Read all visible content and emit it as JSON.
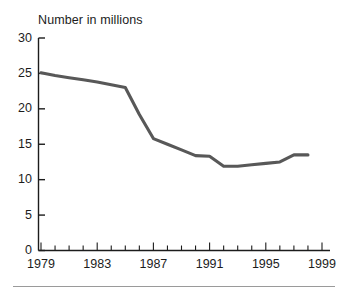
{
  "figure": {
    "title": "Number in millions",
    "line_color": "#585858",
    "axis_color": "#1c1c1c",
    "rule_color": "#9a9a9a",
    "background": "#ffffff"
  },
  "axes": {
    "y_ticks": [
      "0",
      "5",
      "10",
      "15",
      "20",
      "25",
      "30"
    ],
    "x_ticks": [
      "1979",
      "1983",
      "1987",
      "1991",
      "1995",
      "1999"
    ]
  },
  "chart_data": {
    "type": "line",
    "title": "Number in millions",
    "xlabel": "",
    "ylabel": "Number in millions",
    "xlim": [
      1979,
      1999
    ],
    "ylim": [
      0,
      30
    ],
    "ytick_values": [
      0,
      5,
      10,
      15,
      20,
      25,
      30
    ],
    "xtick_values": [
      1979,
      1983,
      1987,
      1991,
      1995,
      1999
    ],
    "minor_xticks": "annual",
    "grid": false,
    "legend": "none",
    "series": [
      {
        "name": "Number in millions",
        "x": [
          1979,
          1980,
          1981,
          1982,
          1983,
          1984,
          1985,
          1986,
          1987,
          1988,
          1989,
          1990,
          1991,
          1992,
          1993,
          1994,
          1995,
          1996,
          1997,
          1998
        ],
        "values": [
          25.1,
          24.7,
          24.4,
          24.1,
          23.8,
          23.4,
          23.0,
          19.2,
          15.8,
          15.0,
          14.2,
          13.4,
          13.3,
          11.9,
          11.9,
          12.1,
          12.3,
          12.5,
          13.5,
          13.5
        ]
      }
    ]
  }
}
